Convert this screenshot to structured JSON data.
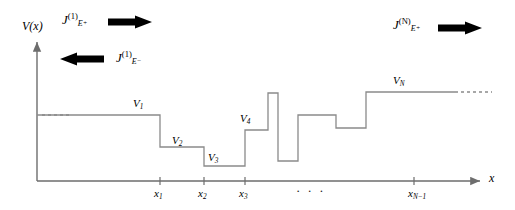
{
  "figure": {
    "type": "potential-step-diagram",
    "background": "#ffffff",
    "stroke": "#8a8a8a",
    "axis_color": "#6d6d6d",
    "text_color": "#000000",
    "width": 515,
    "height": 210
  },
  "axes": {
    "y_label": "V(x)",
    "x_label": "x",
    "origin_x": 37,
    "origin_y": 181,
    "x_end": 480,
    "y_top": 42
  },
  "x_ticks": [
    {
      "label": "x",
      "sub": "1",
      "x": 160
    },
    {
      "label": "x",
      "sub": "2",
      "x": 204
    },
    {
      "label": "x",
      "sub": "3",
      "x": 245
    },
    {
      "label": "x",
      "sub": "N−1",
      "x": 414
    }
  ],
  "x_axis_ellipsis": {
    "text": "· · ·",
    "x": 296,
    "y": 183
  },
  "potential_levels": [
    {
      "label": "V",
      "sub": "1",
      "label_x": 133,
      "label_y": 98,
      "y": 115,
      "x0": 37,
      "x1": 160
    },
    {
      "label": "V",
      "sub": "2",
      "label_x": 172,
      "label_y": 135,
      "y": 147,
      "x0": 160,
      "x1": 204
    },
    {
      "label": "V",
      "sub": "3",
      "label_x": 208,
      "label_y": 152,
      "y": 166,
      "x0": 204,
      "x1": 245
    },
    {
      "label": "V",
      "sub": "4",
      "label_x": 240,
      "label_y": 113,
      "y": 130,
      "x0": 245,
      "x1": 268
    },
    {
      "label": "V",
      "sub": "N",
      "label_x": 393,
      "label_y": 75,
      "y": 92,
      "x0": 366,
      "x1": 455
    }
  ],
  "profile_segments": [
    {
      "y": 115,
      "x0": 37,
      "x1": 160
    },
    {
      "y": 147,
      "x0": 160,
      "x1": 204
    },
    {
      "y": 166,
      "x0": 204,
      "x1": 245
    },
    {
      "y": 130,
      "x0": 245,
      "x1": 268
    },
    {
      "y": 93,
      "x0": 268,
      "x1": 278
    },
    {
      "y": 161,
      "x0": 278,
      "x1": 298
    },
    {
      "y": 115,
      "x0": 298,
      "x1": 336
    },
    {
      "y": 128,
      "x0": 336,
      "x1": 366
    },
    {
      "y": 92,
      "x0": 366,
      "x1": 455
    }
  ],
  "dashed_left": {
    "y": 115,
    "x0": 42,
    "x1": 72
  },
  "dashed_right": {
    "y": 92,
    "x0": 455,
    "x1": 492
  },
  "currents": [
    {
      "name": "incident-current-left",
      "symbol": "J",
      "superscript": "(1)",
      "subscript_base": "E",
      "subscript_sign": "+",
      "direction": "right",
      "label_x": 62,
      "label_y": 12,
      "arrow_x": 108,
      "arrow_y": 22,
      "arrow_length": 44
    },
    {
      "name": "reflected-current-left",
      "symbol": "J",
      "superscript": "(1)",
      "subscript_base": "E",
      "subscript_sign": "−",
      "direction": "left",
      "label_x": 116,
      "label_y": 50,
      "arrow_x": 60,
      "arrow_y": 59,
      "arrow_length": 44
    },
    {
      "name": "transmitted-current-right",
      "symbol": "J",
      "superscript": "(N)",
      "subscript_base": "E",
      "subscript_sign": "+",
      "direction": "right",
      "label_x": 393,
      "label_y": 17,
      "arrow_x": 438,
      "arrow_y": 28,
      "arrow_length": 44
    }
  ]
}
